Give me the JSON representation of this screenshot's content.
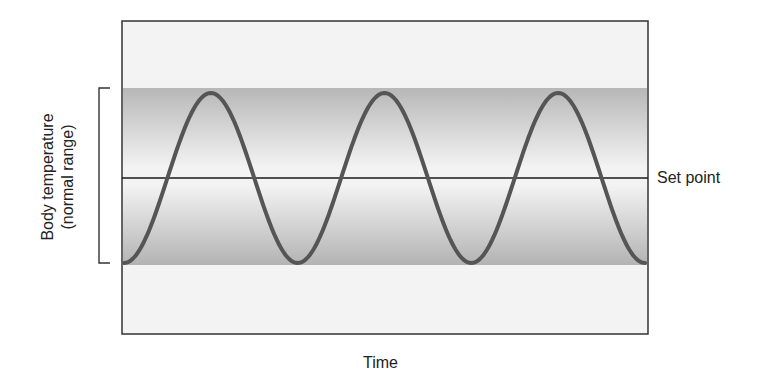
{
  "figure": {
    "y_label_line1": "Body temperature",
    "y_label_line2": "(normal range)",
    "x_label": "Time",
    "set_point_label": "Set point"
  },
  "colors": {
    "background": "#ffffff",
    "plot_fill": "#f3f3f3",
    "band_edge": "#b9b9b9",
    "band_center": "#f2f2f2",
    "curve": "#555555",
    "set_point_line": "#1a1a1a",
    "border": "#333333"
  },
  "chart_data": {
    "type": "line",
    "title": "",
    "xlabel": "Time",
    "ylabel": "Body temperature (normal range)",
    "series": [
      {
        "name": "Body temperature",
        "shape": "sine",
        "cycles": 3,
        "start_phase": "trough",
        "end_phase": "trough",
        "amplitude": "normal range limits",
        "x": [
          0,
          0.5,
          1,
          1.5,
          2,
          2.5,
          3
        ],
        "values": [
          -1,
          1,
          -1,
          1,
          -1,
          1,
          -1
        ]
      }
    ],
    "annotations": [
      {
        "type": "hline",
        "y": 0,
        "label": "Set point"
      },
      {
        "type": "band",
        "y_range": [
          -1,
          1
        ],
        "label": "normal range"
      }
    ],
    "ylim": [
      -2.0,
      1.8
    ],
    "grid": false,
    "legend": "none"
  }
}
